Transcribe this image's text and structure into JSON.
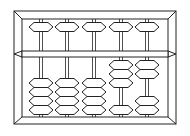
{
  "diagram": {
    "style": "line drawing",
    "stroke_color": "#222222",
    "background_color": "#ffffff",
    "rods": [
      {
        "upper_beads": 1,
        "upper_position": "top",
        "lower_beads_up": 0,
        "lower_beads_down": 4
      },
      {
        "upper_beads": 1,
        "upper_position": "top",
        "lower_beads_up": 0,
        "lower_beads_down": 4
      },
      {
        "upper_beads": 1,
        "upper_position": "top",
        "lower_beads_up": 0,
        "lower_beads_down": 4
      },
      {
        "upper_beads": 1,
        "upper_position": "top",
        "lower_beads_up": 3,
        "lower_beads_down": 1
      },
      {
        "upper_beads": 1,
        "upper_position": "top",
        "lower_beads_up": 2,
        "lower_beads_down": 2
      }
    ],
    "represented_value": "00032"
  }
}
